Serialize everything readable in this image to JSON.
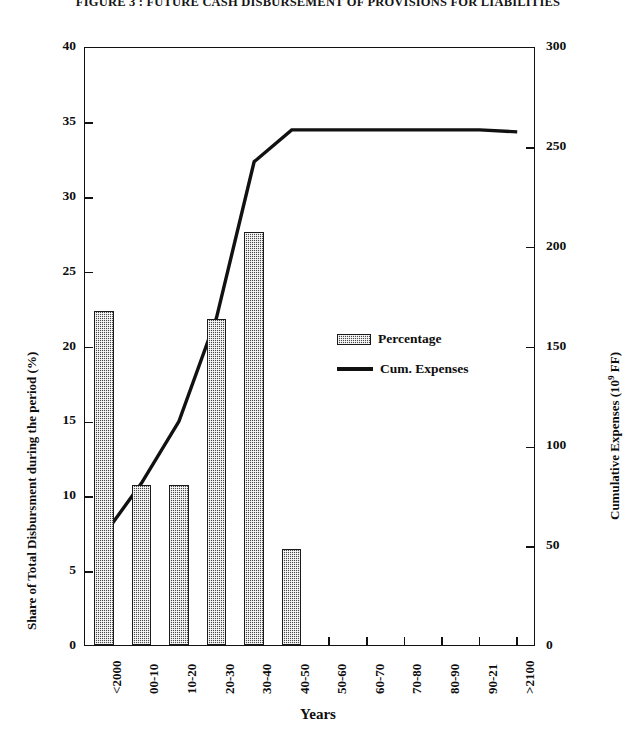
{
  "figure": {
    "title": "FIGURE 3 : FUTURE CASH DISBURSEMENT OF PROVISIONS FOR LIABILITIES"
  },
  "axes": {
    "left": {
      "title": "Share of Total Disbursment during the period (%)",
      "ticks": [
        "0",
        "5",
        "10",
        "15",
        "20",
        "25",
        "30",
        "35",
        "40"
      ],
      "min": 0,
      "max": 40
    },
    "right": {
      "title_main": "Cumulative Expenses (10",
      "title_sup": "9",
      "title_tail": " FF)",
      "title": "Cumulative Expenses (10⁹ FF)",
      "ticks": [
        "0",
        "50",
        "100",
        "150",
        "200",
        "250",
        "300"
      ],
      "min": 0,
      "max": 300
    },
    "bottom": {
      "title": "Years",
      "ticks": [
        "<2000",
        "00-10",
        "10-20",
        "20-30",
        "30-40",
        "40-50",
        "50-60",
        "60-70",
        "70-80",
        "80-90",
        "90-21",
        ">2100"
      ]
    }
  },
  "legend": {
    "items": [
      {
        "label": "Percentage",
        "type": "bar",
        "color": "#4a4a4a"
      },
      {
        "label": "Cum. Expenses",
        "type": "line",
        "color": "#111111"
      }
    ]
  },
  "chart_data": {
    "type": "bar",
    "title": "FIGURE 3 : FUTURE CASH DISBURSEMENT OF PROVISIONS FOR LIABILITIES",
    "xlabel": "Years",
    "ylabel": "Share of Total Disbursment during the period (%)",
    "y2label": "Cumulative Expenses (10⁹ FF)",
    "ylim": [
      0,
      40
    ],
    "y2lim": [
      0,
      300
    ],
    "grid": false,
    "legend_position": "center",
    "categories": [
      "<2000",
      "00-10",
      "10-20",
      "20-30",
      "30-40",
      "40-50",
      "50-60",
      "60-70",
      "70-80",
      "80-90",
      "90-21",
      ">2100"
    ],
    "series": [
      {
        "name": "Percentage",
        "type": "bar",
        "axis": "left",
        "unit": "%",
        "values": [
          22.3,
          10.7,
          10.7,
          21.8,
          27.6,
          6.4,
          0,
          0,
          0,
          0,
          0,
          0
        ]
      },
      {
        "name": "Cum. Expenses",
        "type": "line",
        "axis": "right",
        "unit": "10^9 FF",
        "values": [
          56,
          82,
          113,
          165,
          243,
          259,
          259,
          259,
          259,
          259,
          259,
          258
        ]
      }
    ]
  }
}
